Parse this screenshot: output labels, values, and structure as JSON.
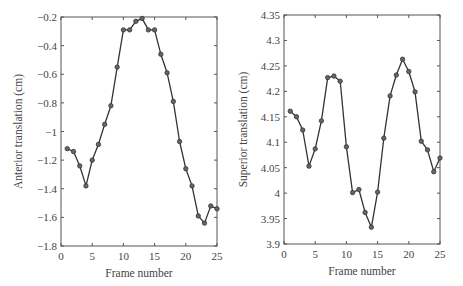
{
  "chart_data": [
    {
      "type": "line",
      "title": "",
      "xlabel": "Frame number",
      "ylabel": "Anterior translation (cm)",
      "xlim": [
        0,
        25
      ],
      "ylim": [
        -1.8,
        -0.2
      ],
      "xticks": [
        0,
        5,
        10,
        15,
        20,
        25
      ],
      "yticks": [
        -1.8,
        -1.6,
        -1.4,
        -1.2,
        -1,
        -0.8,
        -0.6,
        -0.4,
        -0.2
      ],
      "xtick_labels": [
        "0",
        "5",
        "10",
        "15",
        "20",
        "25"
      ],
      "ytick_labels": [
        "-1.8",
        "-1.6",
        "-1.4",
        "-1.2",
        "-1",
        "-0.8",
        "-0.6",
        "-0.4",
        "-0.2"
      ],
      "grid": false,
      "marker": "circle",
      "line_color": "#333333",
      "x": [
        1,
        2,
        3,
        4,
        5,
        6,
        7,
        8,
        9,
        10,
        11,
        12,
        13,
        14,
        15,
        16,
        17,
        18,
        19,
        20,
        21,
        22,
        23,
        24,
        25
      ],
      "values": [
        -1.12,
        -1.14,
        -1.24,
        -1.38,
        -1.2,
        -1.09,
        -0.95,
        -0.82,
        -0.55,
        -0.29,
        -0.29,
        -0.23,
        -0.21,
        -0.29,
        -0.29,
        -0.46,
        -0.59,
        -0.79,
        -1.07,
        -1.26,
        -1.38,
        -1.59,
        -1.64,
        -1.52,
        -1.54
      ]
    },
    {
      "type": "line",
      "title": "",
      "xlabel": "Frame number",
      "ylabel": "Superior translation (cm)",
      "xlim": [
        0,
        25
      ],
      "ylim": [
        3.9,
        4.35
      ],
      "xticks": [
        0,
        5,
        10,
        15,
        20,
        25
      ],
      "yticks": [
        3.9,
        3.95,
        4,
        4.05,
        4.1,
        4.15,
        4.2,
        4.25,
        4.3,
        4.35
      ],
      "xtick_labels": [
        "0",
        "5",
        "10",
        "15",
        "20",
        "25"
      ],
      "ytick_labels": [
        "3.9",
        "3.95",
        "4",
        "4.05",
        "4.1",
        "4.15",
        "4.2",
        "4.25",
        "4.3",
        "4.35"
      ],
      "grid": false,
      "marker": "circle",
      "line_color": "#333333",
      "x": [
        1,
        2,
        3,
        4,
        5,
        6,
        7,
        8,
        9,
        10,
        11,
        12,
        13,
        14,
        15,
        16,
        17,
        18,
        19,
        20,
        21,
        22,
        23,
        24,
        25
      ],
      "values": [
        4.161,
        4.15,
        4.124,
        4.053,
        4.087,
        4.142,
        4.227,
        4.23,
        4.22,
        4.091,
        4.001,
        4.007,
        3.962,
        3.933,
        4.002,
        4.108,
        4.191,
        4.232,
        4.263,
        4.239,
        4.199,
        4.102,
        4.085,
        4.042,
        4.069
      ]
    }
  ],
  "layout": {
    "panels": [
      {
        "left": 61,
        "top": 17,
        "right": 217,
        "bottom": 246
      },
      {
        "left": 284,
        "top": 15,
        "right": 440,
        "bottom": 244
      }
    ]
  }
}
